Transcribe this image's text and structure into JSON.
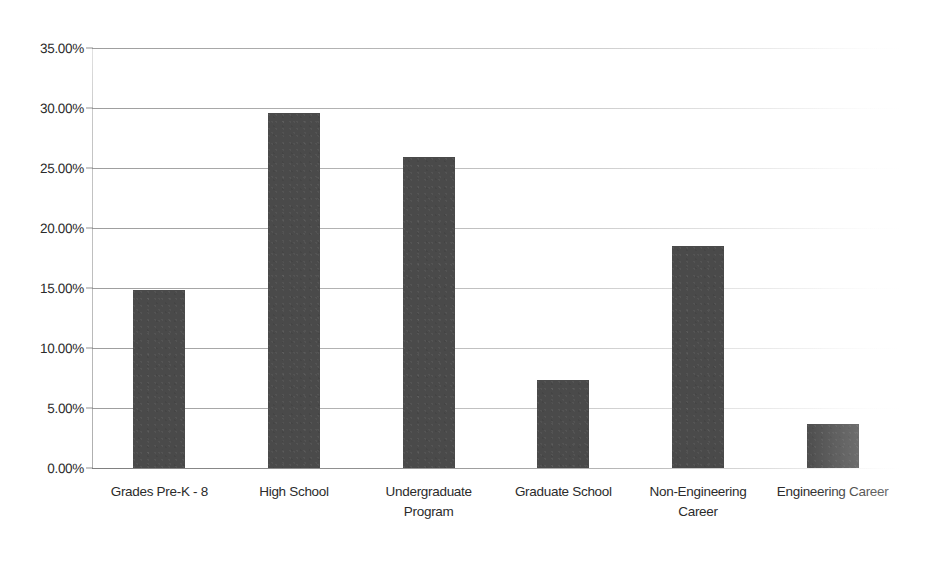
{
  "chart_data": {
    "type": "bar",
    "title": "",
    "subtitle": "",
    "xlabel": "",
    "ylabel": "",
    "categories": [
      "Grades Pre-K - 8",
      "High School",
      "Undergraduate\nProgram",
      "Graduate School",
      "Non-Engineering\nCareer",
      "Engineering Career"
    ],
    "values": [
      14.8,
      29.6,
      25.9,
      7.35,
      18.5,
      3.7
    ],
    "value_labels": [
      "14.80%",
      "29.60%",
      "25.90%",
      "7.35%",
      "18.50%",
      "3.70%"
    ],
    "ylim": [
      0,
      35
    ],
    "ytick_values": [
      0,
      5,
      10,
      15,
      20,
      25,
      30,
      35
    ],
    "ytick_labels": [
      "0.00%",
      "5.00%",
      "10.00%",
      "15.00%",
      "20.00%",
      "25.00%",
      "30.00%",
      "35.00%"
    ],
    "grid": true,
    "grid_axis": "y",
    "legend": false,
    "legend_position": "none",
    "series": [
      {
        "name": "",
        "values": [
          14.8,
          29.6,
          25.9,
          7.35,
          18.5,
          3.7
        ]
      }
    ]
  },
  "style": {
    "bar_color": "#4a4a4a",
    "gridline_color": "#8c8c8c",
    "text_color": "#2b2b2b",
    "background_color": "#ffffff"
  }
}
